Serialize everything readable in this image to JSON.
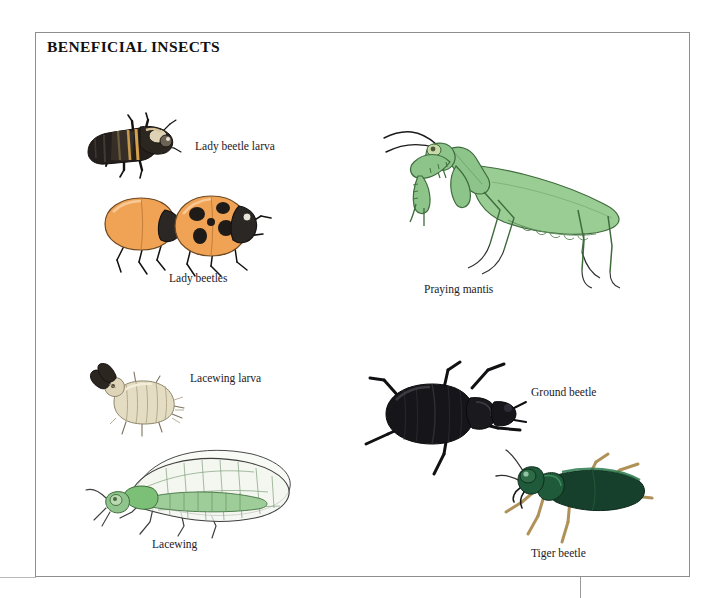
{
  "page": {
    "title": "BENEFICIAL INSECTS",
    "background_color": "#ffffff",
    "frame_border_color": "#8e8e8e"
  },
  "figures": [
    {
      "id": "lady-beetle-larva",
      "label": "Lady beetle larva",
      "description": "Dark elongated segmented larva with orange and tan markings, six legs, oriented diagonally",
      "colors": {
        "body": "#241f1c",
        "markings": "#d7a04a",
        "highlight": "#e8dcc0"
      }
    },
    {
      "id": "lady-beetles",
      "label": "Lady beetles",
      "description": "Two orange ladybird beetles, the rear one plain orange and the front one with black spots, black heads and legs",
      "colors": {
        "elytra": "#f0a355",
        "spots": "#1f1b18",
        "head": "#2b2724",
        "legs": "#141210"
      }
    },
    {
      "id": "praying-mantis",
      "label": "Praying mantis",
      "description": "Large green praying mantis facing left with raised grasping forelegs, long antennae and long tapering wings",
      "colors": {
        "body": "#8cc489",
        "wing": "#a8d4a2",
        "outline": "#3f6b3d",
        "antenna": "#1a1a1a"
      }
    },
    {
      "id": "lacewing-larva",
      "label": "Lacewing larva",
      "description": "Pale cream segmented alligator-like larva with large dark curved sickle mandibles",
      "colors": {
        "body": "#e4ddc4",
        "shade": "#bdb393",
        "mandibles": "#2b2620"
      }
    },
    {
      "id": "ground-beetle",
      "label": "Ground beetle",
      "description": "Glossy black ground beetle with broad oval elytra, head to the right, long spiny legs",
      "colors": {
        "body": "#16161a",
        "sheen": "#3a3a40",
        "legs": "#111114"
      }
    },
    {
      "id": "lacewing",
      "label": "Lacewing",
      "description": "Green lacewing with slender green body and two large transparent net-veined wings",
      "colors": {
        "body": "#8fc48c",
        "wing": "#f2f6ef",
        "veins": "#6d8f6c",
        "outline": "#4a4a4a"
      }
    },
    {
      "id": "tiger-beetle",
      "label": "Tiger beetle",
      "description": "Metallic dark green tiger beetle with large eyes, head to the left and long tan legs",
      "colors": {
        "body": "#1f5a3a",
        "elytra": "#16402b",
        "legs": "#b09258",
        "eye": "#2f6b46"
      }
    }
  ]
}
